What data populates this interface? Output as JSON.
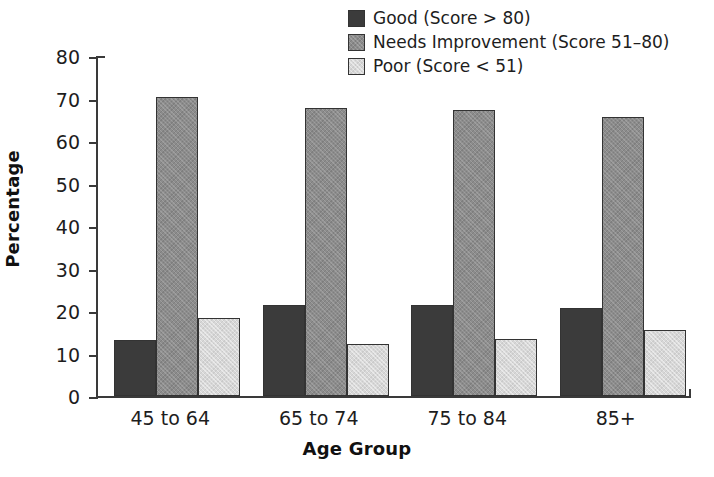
{
  "chart_data": {
    "type": "bar",
    "title": "",
    "xlabel": "Age Group",
    "ylabel": "Percentage",
    "categories": [
      "45 to 64",
      "65 to 74",
      "75 to 84",
      "85+"
    ],
    "series": [
      {
        "name": "Good (Score > 80)",
        "color": "#3b3b3b",
        "values": [
          13.2,
          21.3,
          21.5,
          20.7
        ]
      },
      {
        "name": "Needs Improvement (Score 51–80)",
        "color": "#8c8c8c",
        "values": [
          70.4,
          67.8,
          67.4,
          65.7
        ]
      },
      {
        "name": "Poor (Score < 51)",
        "color": "#d7d7d7",
        "values": [
          18.3,
          12.2,
          13.4,
          15.5
        ]
      }
    ],
    "ylim": [
      0,
      80
    ],
    "yticks": [
      0,
      10,
      20,
      30,
      40,
      50,
      60,
      70,
      80
    ],
    "ytick_labels": [
      "0",
      "10",
      "20",
      "30",
      "40",
      "50",
      "60",
      "70",
      "80"
    ],
    "grid": false,
    "legend_position": "top-center"
  },
  "legend": {
    "items": [
      {
        "label": "Good (Score > 80)",
        "swatch": "legend-swatch-good"
      },
      {
        "label": "Needs Improvement (Score 51–80)",
        "swatch": "legend-swatch-needs-improvement"
      },
      {
        "label": "Poor (Score < 51)",
        "swatch": "legend-swatch-poor"
      }
    ]
  }
}
